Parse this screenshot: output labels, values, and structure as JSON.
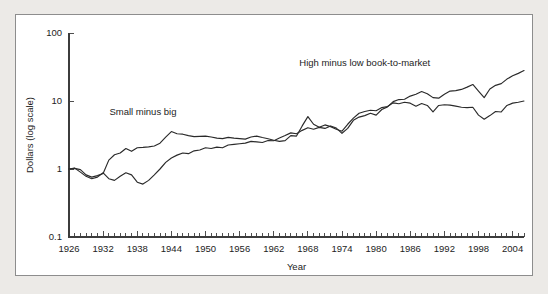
{
  "chart_data": {
    "type": "line",
    "title": "",
    "xlabel": "Year",
    "ylabel": "Dollars (log scale)",
    "yscale": "log",
    "ylim": [
      0.1,
      100
    ],
    "xlim": [
      1926,
      2006
    ],
    "grid": false,
    "legend_position": "inline-annotations",
    "ytick_labels": [
      "100",
      "10",
      "1",
      "0.1"
    ],
    "ytick_values": [
      100,
      10,
      1,
      0.1
    ],
    "xtick_labels": [
      "1926",
      "1932",
      "1938",
      "1944",
      "1950",
      "1956",
      "1962",
      "1968",
      "1974",
      "1980",
      "1986",
      "1992",
      "1998",
      "2004"
    ],
    "xtick_values": [
      1926,
      1932,
      1938,
      1944,
      1950,
      1956,
      1962,
      1968,
      1974,
      1980,
      1986,
      1992,
      1998,
      2004
    ],
    "xtick_minor_step": 1,
    "annotations": [
      {
        "text": "Small minus big",
        "x": 1939,
        "y": 6.2
      },
      {
        "text": "High minus low book-to-market",
        "x": 1978,
        "y": 33
      }
    ],
    "x": [
      1926,
      1927,
      1928,
      1929,
      1930,
      1931,
      1932,
      1933,
      1934,
      1935,
      1936,
      1937,
      1938,
      1939,
      1940,
      1941,
      1942,
      1943,
      1944,
      1945,
      1946,
      1947,
      1948,
      1949,
      1950,
      1951,
      1952,
      1953,
      1954,
      1955,
      1956,
      1957,
      1958,
      1959,
      1960,
      1961,
      1962,
      1963,
      1964,
      1965,
      1966,
      1967,
      1968,
      1969,
      1970,
      1971,
      1972,
      1973,
      1974,
      1975,
      1976,
      1977,
      1978,
      1979,
      1980,
      1981,
      1982,
      1983,
      1984,
      1985,
      1986,
      1987,
      1988,
      1989,
      1990,
      1991,
      1992,
      1993,
      1994,
      1995,
      1996,
      1997,
      1998,
      1999,
      2000,
      2001,
      2002,
      2003,
      2004,
      2005,
      2006
    ],
    "series": [
      {
        "name": "Small minus big",
        "label": "Small minus big",
        "color": "#2a2a2a",
        "values": [
          1.0,
          1.02,
          0.98,
          0.82,
          0.76,
          0.8,
          0.86,
          1.35,
          1.62,
          1.72,
          2.0,
          1.82,
          2.05,
          2.08,
          2.12,
          2.18,
          2.4,
          2.95,
          3.55,
          3.3,
          3.25,
          3.1,
          3.0,
          3.02,
          3.05,
          2.95,
          2.85,
          2.8,
          2.92,
          2.85,
          2.8,
          2.75,
          2.95,
          3.05,
          2.9,
          2.78,
          2.65,
          2.55,
          2.62,
          3.1,
          3.05,
          4.3,
          5.9,
          4.55,
          4.1,
          4.45,
          4.2,
          3.85,
          3.6,
          4.55,
          5.6,
          6.6,
          7.0,
          7.3,
          7.2,
          8.0,
          8.3,
          9.4,
          9.1,
          9.6,
          9.3,
          8.4,
          9.2,
          8.6,
          6.9,
          8.6,
          8.8,
          8.7,
          8.4,
          8.1,
          8.0,
          8.1,
          6.2,
          5.4,
          6.1,
          7.0,
          6.9,
          8.6,
          9.3,
          9.6,
          10.0
        ]
      },
      {
        "name": "High minus low book-to-market",
        "label": "High minus low book-to-market",
        "color": "#2a2a2a",
        "values": [
          1.0,
          1.03,
          0.9,
          0.78,
          0.72,
          0.76,
          0.88,
          0.72,
          0.68,
          0.78,
          0.88,
          0.82,
          0.64,
          0.6,
          0.68,
          0.82,
          1.0,
          1.25,
          1.45,
          1.6,
          1.72,
          1.68,
          1.85,
          1.9,
          2.05,
          2.0,
          2.1,
          2.05,
          2.25,
          2.3,
          2.35,
          2.4,
          2.55,
          2.5,
          2.45,
          2.62,
          2.6,
          2.85,
          3.1,
          3.4,
          3.3,
          3.7,
          4.05,
          3.85,
          4.1,
          3.95,
          4.3,
          4.0,
          3.35,
          3.95,
          5.2,
          5.8,
          6.1,
          6.6,
          6.2,
          7.5,
          8.2,
          9.8,
          10.5,
          10.6,
          11.8,
          12.6,
          13.8,
          12.8,
          11.2,
          11.0,
          12.6,
          14.0,
          14.2,
          14.8,
          16.0,
          17.5,
          14.0,
          11.2,
          15.0,
          17.0,
          18.0,
          21.0,
          23.5,
          25.5,
          28.0
        ]
      }
    ]
  }
}
